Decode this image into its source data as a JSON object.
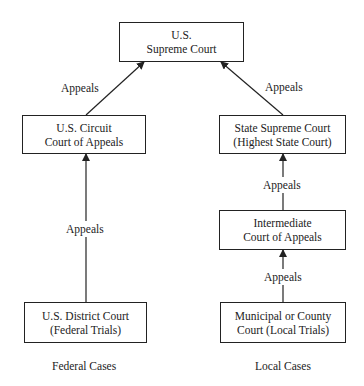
{
  "diagram": {
    "nodes": {
      "supreme": {
        "line1": "U.S.",
        "line2": "Supreme Court"
      },
      "circuit": {
        "line1": "U.S. Circuit",
        "line2": "Court of Appeals"
      },
      "state_supreme": {
        "line1": "State Supreme Court",
        "line2": "(Highest State Court)"
      },
      "intermediate": {
        "line1": "Intermediate",
        "line2": "Court of Appeals"
      },
      "district": {
        "line1": "U.S. District Court",
        "line2": "(Federal Trials)"
      },
      "municipal": {
        "line1": "Municipal or County",
        "line2": "Court (Local Trials)"
      }
    },
    "edge_labels": {
      "circuit_to_supreme": "Appeals",
      "state_to_supreme": "Appeals",
      "district_to_circuit": "Appeals",
      "intermediate_to_state": "Appeals",
      "municipal_to_intermediate": "Appeals"
    },
    "columns": {
      "federal": "Federal Cases",
      "local": "Local Cases"
    }
  }
}
